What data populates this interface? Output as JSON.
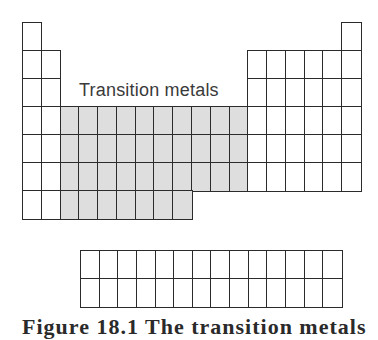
{
  "diagram": {
    "highlight_label": "Transition metals",
    "caption": "Figure 18.1   The transition metals",
    "colors": {
      "line": "#2b2b2b",
      "shaded": "#dedede",
      "background": "#ffffff"
    },
    "main_table": {
      "columns": 18,
      "rows": 7,
      "row_layout": [
        {
          "row": 1,
          "cells": [
            1,
            18
          ],
          "shaded": []
        },
        {
          "row": 2,
          "cells": [
            1,
            2,
            13,
            14,
            15,
            16,
            17,
            18
          ],
          "shaded": []
        },
        {
          "row": 3,
          "cells": [
            1,
            2,
            13,
            14,
            15,
            16,
            17,
            18
          ],
          "shaded": []
        },
        {
          "row": 4,
          "cells": [
            1,
            2,
            3,
            4,
            5,
            6,
            7,
            8,
            9,
            10,
            11,
            12,
            13,
            14,
            15,
            16,
            17,
            18
          ],
          "shaded": [
            3,
            4,
            5,
            6,
            7,
            8,
            9,
            10,
            11,
            12
          ]
        },
        {
          "row": 5,
          "cells": [
            1,
            2,
            3,
            4,
            5,
            6,
            7,
            8,
            9,
            10,
            11,
            12,
            13,
            14,
            15,
            16,
            17,
            18
          ],
          "shaded": [
            3,
            4,
            5,
            6,
            7,
            8,
            9,
            10,
            11,
            12
          ]
        },
        {
          "row": 6,
          "cells": [
            1,
            2,
            3,
            4,
            5,
            6,
            7,
            8,
            9,
            10,
            11,
            12,
            13,
            14,
            15,
            16,
            17,
            18
          ],
          "shaded": [
            3,
            4,
            5,
            6,
            7,
            8,
            9,
            10,
            11,
            12
          ]
        },
        {
          "row": 7,
          "cells": [
            1,
            2,
            3,
            4,
            5,
            6,
            7,
            8,
            9
          ],
          "shaded": [
            3,
            4,
            5,
            6,
            7,
            8,
            9
          ]
        }
      ]
    },
    "f_block": {
      "columns": 14,
      "rows": 2
    }
  }
}
